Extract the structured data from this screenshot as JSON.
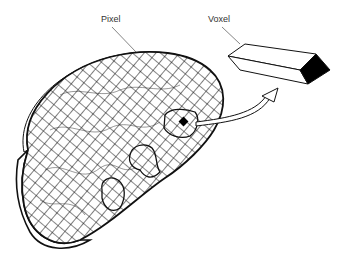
{
  "diagram": {
    "labels": {
      "pixel": "Pixel",
      "voxel": "Voxel"
    },
    "elements": [
      {
        "name": "cross-section-slice",
        "description": "kidney-shaped tissue slice with grid overlay"
      },
      {
        "name": "voxel-prism",
        "description": "rectangular prism with black end face"
      },
      {
        "name": "arrow",
        "description": "curved arrow from highlighted pixel to voxel"
      }
    ],
    "colors": {
      "line": "#111111",
      "background": "#ffffff",
      "highlight": "#000000"
    }
  }
}
